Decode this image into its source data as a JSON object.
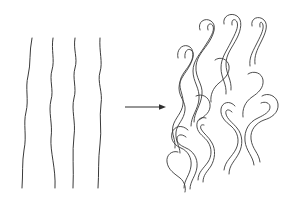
{
  "figure": {
    "domain": "Diagram",
    "background_color": "#ffffff",
    "stroke_color": "#3a3a3a",
    "arrow_color": "#2e2e2e",
    "width": 303,
    "height": 199,
    "visible_text": []
  },
  "left_panel": {
    "name": "extended-aligned-polymer-chains",
    "description": "Four nearly parallel, gently wavy vertical single-line chains",
    "chain_count": 4,
    "chains": [
      {
        "id": "chain-1",
        "path": "M 32 38 C 29 52 31 64 28 76 C 25 88 29 100 26 112 C 23 124 27 136 24 150 C 22 162 23 174 22 188"
      },
      {
        "id": "chain-2",
        "path": "M 53 38 C 51 50 55 60 52 70 C 49 80 54 90 51 100 C 48 112 53 124 51 138 C 50 152 56 168 55 188"
      },
      {
        "id": "chain-3",
        "path": "M 75 38 C 73 50 78 58 75 68 C 72 78 77 88 74 98 C 71 110 76 122 74 136 C 72 152 74 170 73 188"
      },
      {
        "id": "chain-4",
        "path": "M 100 38 C 99 52 103 62 100 72 C 97 82 103 92 101 104 C 99 118 102 130 100 144 C 98 160 99 174 98 188"
      }
    ]
  },
  "arrow": {
    "name": "transition-arrow",
    "direction": "right",
    "x_start": 125,
    "x_end": 166,
    "y": 107,
    "label": ""
  },
  "right_panel": {
    "name": "random-coiled-entangled-polymer-chains",
    "description": "Dense cluster of meandering, folded, outlined ribbon-like chains forming a random coil / amorphous entangled region",
    "bounds": {
      "x": 168,
      "y": 12,
      "width": 128,
      "height": 180
    },
    "coils": [
      {
        "id": "coil-1",
        "path": "M 178 58 C 176 50 182 44 188 46 C 194 48 194 56 191 62 C 187 70 181 74 180 82 C 179 90 184 96 183 104 C 182 113 175 118 173 126 C 171 134 176 140 175 148"
      },
      {
        "id": "coil-2",
        "path": "M 185 58 C 184 51 188 48 191 50 C 195 53 193 59 190 65 C 186 73 179 79 179 88 C 179 97 186 102 185 110 C 184 120 177 124 176 132 C 175 141 180 146 180 153"
      },
      {
        "id": "coil-3",
        "path": "M 200 30 C 197 22 205 17 211 21 C 217 25 214 34 209 42 C 204 50 197 56 196 66 C 195 78 203 84 202 94 C 201 106 194 112 194 122"
      },
      {
        "id": "coil-4",
        "path": "M 208 30 C 206 24 211 22 213 26 C 215 31 210 38 205 46 C 200 54 193 61 193 71 C 193 82 200 88 199 99 C 198 110 191 116 191 126"
      },
      {
        "id": "coil-5",
        "path": "M 224 24 C 222 16 231 12 237 16 C 243 20 241 30 237 38 C 232 48 226 54 226 64 C 226 74 232 80 231 90"
      },
      {
        "id": "coil-6",
        "path": "M 232 25 C 231 19 235 18 237 22 C 239 27 235 34 231 42 C 226 52 221 58 221 68 C 221 78 227 84 226 94"
      },
      {
        "id": "coil-7",
        "path": "M 252 26 C 250 18 259 15 264 20 C 269 25 265 34 261 42 C 257 50 254 56 255 64"
      },
      {
        "id": "coil-8",
        "path": "M 260 27 C 259 21 262 21 263 25 C 264 30 260 37 256 45 C 252 53 249 58 250 66"
      },
      {
        "id": "coil-9",
        "path": "M 188 130 C 182 124 174 126 172 133 C 170 141 176 146 181 148 C 188 151 192 158 191 166 C 190 175 184 180 184 188"
      },
      {
        "id": "coil-10",
        "path": "M 186 137 C 181 133 177 135 177 139 C 177 144 182 146 186 148 C 193 151 198 158 197 167 C 196 176 190 181 190 189"
      },
      {
        "id": "coil-11",
        "path": "M 206 118 C 200 116 196 121 197 127 C 198 134 205 137 208 142 C 212 148 212 156 208 162 C 204 168 198 172 198 180"
      },
      {
        "id": "coil-12",
        "path": "M 204 125 C 201 124 200 126 201 129 C 203 133 209 137 212 143 C 216 150 215 159 211 166 C 207 172 203 175 203 182"
      },
      {
        "id": "coil-13",
        "path": "M 235 106 C 230 100 222 102 221 109 C 220 117 226 122 231 126 C 238 132 240 141 236 149 C 232 157 225 161 224 170"
      },
      {
        "id": "coil-14",
        "path": "M 232 112 C 228 108 225 110 226 114 C 227 119 233 123 237 128 C 243 135 243 145 239 153 C 235 161 229 165 229 174"
      },
      {
        "id": "coil-15",
        "path": "M 262 96 C 268 92 277 96 278 104 C 279 113 271 118 264 120 C 256 123 250 130 251 139 C 252 149 259 153 260 162"
      },
      {
        "id": "coil-16",
        "path": "M 261 103 C 265 101 270 103 270 107 C 270 112 264 115 258 118 C 249 122 244 130 245 141 C 246 151 253 156 254 165"
      },
      {
        "id": "coil-17",
        "path": "M 178 152 C 172 150 166 155 167 162 C 168 170 175 174 180 178 C 185 182 186 188 185 192"
      },
      {
        "id": "coil-18",
        "path": "M 215 60 C 220 56 228 59 229 66 C 230 74 224 79 219 83 C 213 88 210 95 211 102"
      },
      {
        "id": "coil-19",
        "path": "M 248 74 C 254 70 262 73 263 80 C 264 88 258 93 252 97 C 245 102 242 109 243 117"
      },
      {
        "id": "coil-20",
        "path": "M 196 96 C 202 93 209 97 210 104 C 211 112 205 116 199 120"
      }
    ]
  }
}
